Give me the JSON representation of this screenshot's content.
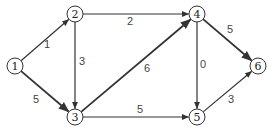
{
  "diagram": {
    "type": "directed-weighted-graph",
    "nodes": [
      {
        "id": "1",
        "label": "1",
        "x": 15,
        "y": 66
      },
      {
        "id": "2",
        "label": "2",
        "x": 75,
        "y": 14
      },
      {
        "id": "3",
        "label": "3",
        "x": 75,
        "y": 117
      },
      {
        "id": "4",
        "label": "4",
        "x": 197,
        "y": 14
      },
      {
        "id": "5",
        "label": "5",
        "x": 197,
        "y": 117
      },
      {
        "id": "6",
        "label": "6",
        "x": 258,
        "y": 66
      }
    ],
    "edges": [
      {
        "from": "1",
        "to": "2",
        "weight": "1",
        "lx": 47,
        "ly": 44
      },
      {
        "from": "1",
        "to": "3",
        "weight": "5",
        "lx": 36,
        "ly": 99,
        "bold": true
      },
      {
        "from": "2",
        "to": "4",
        "weight": "2",
        "lx": 130,
        "ly": 21
      },
      {
        "from": "2",
        "to": "3",
        "weight": "3",
        "lx": 82,
        "ly": 61
      },
      {
        "from": "3",
        "to": "4",
        "weight": "6",
        "lx": 147,
        "ly": 68,
        "bold": true
      },
      {
        "from": "3",
        "to": "5",
        "weight": "5",
        "lx": 140,
        "ly": 109
      },
      {
        "from": "4",
        "to": "5",
        "weight": "0",
        "lx": 203,
        "ly": 64
      },
      {
        "from": "4",
        "to": "6",
        "weight": "5",
        "lx": 230,
        "ly": 29,
        "bold": true
      },
      {
        "from": "5",
        "to": "6",
        "weight": "3",
        "lx": 231,
        "ly": 99
      }
    ]
  }
}
